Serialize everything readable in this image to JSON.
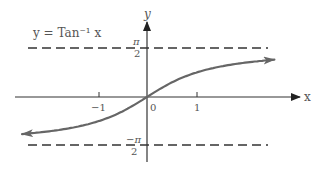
{
  "chart_data": {
    "type": "line",
    "title": "y = Tan⁻¹ x",
    "function": "arctan(x)",
    "xlabel": "x",
    "ylabel": "y",
    "x_ticks": [
      {
        "value": -1,
        "label": "−1"
      },
      {
        "value": 0,
        "label": "0"
      },
      {
        "value": 1,
        "label": "1"
      }
    ],
    "y_ticks": [
      {
        "value": 1.5708,
        "label_num": "π",
        "label_den": "2"
      },
      {
        "value": -1.5708,
        "label_num": "−π",
        "label_den": "2"
      }
    ],
    "asymptotes": [
      {
        "y": 1.5708,
        "label": "π/2",
        "style": "dashed"
      },
      {
        "y": -1.5708,
        "label": "−π/2",
        "style": "dashed"
      }
    ],
    "series": [
      {
        "name": "y = Tan⁻¹ x",
        "note": "Points computed from arctan(x), not read from the image; the curve in the image sits slightly higher at its right end than the true function at this scale.",
        "x": [
          -2.5,
          -2,
          -1.5,
          -1,
          -0.5,
          0,
          0.5,
          1,
          1.5,
          2,
          2.5
        ],
        "values": [
          -1.19,
          -1.107,
          -0.983,
          -0.785,
          -0.464,
          0,
          0.464,
          0.785,
          0.983,
          1.107,
          1.19
        ],
        "arrows_both_ends": true,
        "color": "#666666"
      }
    ],
    "xlim": [
      -2.7,
      3.1
    ],
    "ylim": [
      -2.0,
      2.4
    ],
    "grid": false,
    "legend": "none"
  },
  "colors": {
    "axis": "#333333",
    "curve": "#666666",
    "dash": "#333333",
    "text": "#555555"
  }
}
